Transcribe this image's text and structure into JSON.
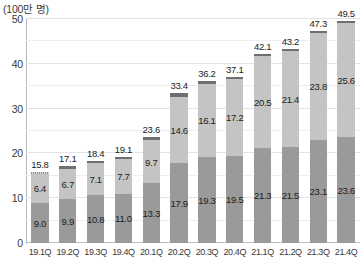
{
  "unit_caption": "(100만 명)",
  "chart_data": {
    "type": "bar",
    "title": "",
    "subtitle": "",
    "xlabel": "",
    "ylabel": "",
    "unit": "(100만 명)",
    "stacked": true,
    "grid": true,
    "legend_position": "none",
    "ylim": [
      0,
      50
    ],
    "y_ticks": [
      0,
      10,
      20,
      30,
      40,
      50
    ],
    "y_ticks_minor": [
      5,
      15,
      25,
      35,
      45
    ],
    "categories": [
      "19.1Q",
      "19.2Q",
      "19.3Q",
      "19.4Q",
      "20.1Q",
      "20.2Q",
      "20.3Q",
      "20.4Q",
      "21.1Q",
      "21.2Q",
      "21.3Q",
      "21.4Q"
    ],
    "series": [
      {
        "name": "lower-segment",
        "color": "#9a9a9a",
        "values": [
          9.0,
          9.9,
          10.8,
          11.0,
          13.3,
          17.9,
          19.3,
          19.5,
          21.3,
          21.5,
          23.1,
          23.6
        ]
      },
      {
        "name": "upper-segment",
        "color": "#c4c4c4",
        "values": [
          6.4,
          6.7,
          7.1,
          7.7,
          9.7,
          14.6,
          16.1,
          17.2,
          20.5,
          21.4,
          23.8,
          25.6
        ]
      },
      {
        "name": "top-cap-segment",
        "color": "#6f6f6f",
        "values": [
          0.4,
          0.5,
          0.5,
          0.4,
          0.6,
          0.9,
          0.8,
          0.4,
          0.3,
          0.3,
          0.4,
          0.3
        ]
      }
    ],
    "totals": [
      15.8,
      17.1,
      18.4,
      19.1,
      23.6,
      33.4,
      36.2,
      37.1,
      42.1,
      43.2,
      47.3,
      49.5
    ]
  },
  "colors": {
    "lower_segment": "#9a9a9a",
    "upper_segment": "#c4c4c4",
    "top_cap": "#6f6f6f",
    "gridline": "#e3e3e3",
    "axis": "#b9b9b9",
    "text": "#1c1c1c",
    "background": "#ffffff"
  }
}
